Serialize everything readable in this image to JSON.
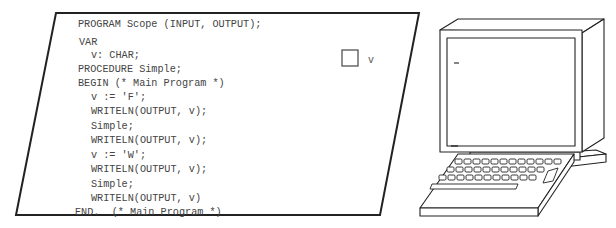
{
  "diagram": {
    "program_panel": {
      "shape": "parallelogram",
      "code_lines": [
        {
          "text": "PROGRAM Scope (INPUT, OUTPUT);",
          "indent": 0
        },
        {
          "text": "VAR",
          "indent": 0
        },
        {
          "text": "v: CHAR;",
          "indent": 1
        },
        {
          "text": "PROCEDURE Simple;",
          "indent": 0
        },
        {
          "text": "BEGIN (* Main Program *)",
          "indent": 0
        },
        {
          "text": "v := 'F';",
          "indent": 1
        },
        {
          "text": "WRITELN(OUTPUT, v);",
          "indent": 1
        },
        {
          "text": "Simple;",
          "indent": 1
        },
        {
          "text": "WRITELN(OUTPUT, v);",
          "indent": 1
        },
        {
          "text": "v := 'W';",
          "indent": 1
        },
        {
          "text": "WRITELN(OUTPUT, v);",
          "indent": 1
        },
        {
          "text": "Simple;",
          "indent": 1
        },
        {
          "text": "WRITELN(OUTPUT, v)",
          "indent": 1
        },
        {
          "text": "END.  (* Main Program *)",
          "indent": 0
        }
      ]
    },
    "memory_cell": {
      "label": "v",
      "value": ""
    },
    "computer": {
      "screen_text": "_",
      "keyboard_rows": [
        13,
        13,
        13
      ]
    },
    "colors": {
      "line": "#222222",
      "text": "#444444",
      "background": "#ffffff"
    }
  }
}
